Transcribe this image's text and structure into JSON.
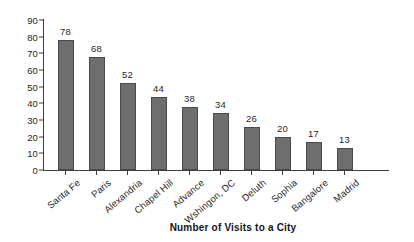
{
  "chart_data": {
    "type": "bar",
    "title": "",
    "xlabel": "Number of Visits to a City",
    "ylabel": "",
    "categories": [
      "Santa Fe",
      "Paris",
      "Alexandria",
      "Chapel Hill",
      "Advance",
      "Wshingon, DC",
      "Deluth",
      "Sophia",
      "Bangalore",
      "Madrid"
    ],
    "values": [
      78,
      68,
      52,
      44,
      38,
      34,
      26,
      20,
      17,
      13
    ],
    "ylim": [
      0,
      90
    ],
    "ytick_labels": [
      "0",
      "10",
      "20",
      "30",
      "40",
      "50",
      "60",
      "70",
      "80",
      "90"
    ],
    "ytick_values": [
      0,
      10,
      20,
      30,
      40,
      50,
      60,
      70,
      80,
      90
    ],
    "grid": false,
    "legend": false,
    "bar_color": "#6e6e6e",
    "bar_edge_color": "#4a4a4a",
    "axis_color": "#3d3d3d",
    "background": "#ffffff",
    "data_labels_shown": true,
    "xtick_label_rotation": -40
  }
}
